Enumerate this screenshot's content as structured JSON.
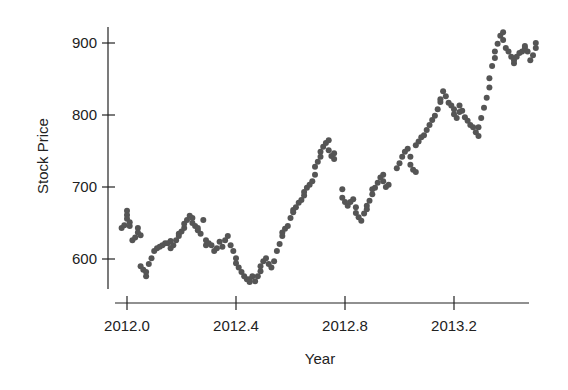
{
  "chart_data": {
    "type": "scatter",
    "title": "",
    "xlabel": "Year",
    "ylabel": "Stock Price",
    "xlim": [
      1999.9,
      2013.58
    ],
    "x_axis_range": [
      1999.98,
      2013.51
    ],
    "ylim": [
      560,
      920
    ],
    "x_ticks": [
      2012.0,
      2012.4,
      2012.8,
      2013.2
    ],
    "x_tick_labels": [
      "2012.0",
      "2012.4",
      "2012.8",
      "2013.2"
    ],
    "y_ticks": [
      600,
      700,
      800,
      900
    ],
    "y_tick_labels": [
      "600",
      "700",
      "800",
      "900"
    ],
    "grid": false,
    "legend": null,
    "point_color": "#555555",
    "series": [
      {
        "name": "Stock Price",
        "points": [
          [
            2011.98,
            643
          ],
          [
            2011.99,
            647
          ],
          [
            2012.0,
            667
          ],
          [
            2012.0,
            661
          ],
          [
            2012.0,
            656
          ],
          [
            2012.01,
            651
          ],
          [
            2012.01,
            646
          ],
          [
            2012.02,
            626
          ],
          [
            2012.03,
            630
          ],
          [
            2012.04,
            637
          ],
          [
            2012.04,
            643
          ],
          [
            2012.05,
            633
          ],
          [
            2012.05,
            590
          ],
          [
            2012.06,
            585
          ],
          [
            2012.07,
            576
          ],
          [
            2012.07,
            582
          ],
          [
            2012.08,
            593
          ],
          [
            2012.09,
            601
          ],
          [
            2012.1,
            611
          ],
          [
            2012.11,
            615
          ],
          [
            2012.12,
            617
          ],
          [
            2012.13,
            619
          ],
          [
            2012.14,
            622
          ],
          [
            2012.15,
            622
          ],
          [
            2012.16,
            625
          ],
          [
            2012.16,
            615
          ],
          [
            2012.17,
            619
          ],
          [
            2012.18,
            626
          ],
          [
            2012.19,
            632
          ],
          [
            2012.19,
            635
          ],
          [
            2012.2,
            638
          ],
          [
            2012.21,
            643
          ],
          [
            2012.21,
            649
          ],
          [
            2012.22,
            654
          ],
          [
            2012.23,
            660
          ],
          [
            2012.24,
            657
          ],
          [
            2012.24,
            650
          ],
          [
            2012.25,
            646
          ],
          [
            2012.26,
            643
          ],
          [
            2012.26,
            640
          ],
          [
            2012.27,
            635
          ],
          [
            2012.28,
            654
          ],
          [
            2012.29,
            626
          ],
          [
            2012.29,
            619
          ],
          [
            2012.3,
            622
          ],
          [
            2012.31,
            619
          ],
          [
            2012.32,
            611
          ],
          [
            2012.33,
            615
          ],
          [
            2012.34,
            624
          ],
          [
            2012.35,
            617
          ],
          [
            2012.36,
            626
          ],
          [
            2012.37,
            632
          ],
          [
            2012.38,
            619
          ],
          [
            2012.39,
            611
          ],
          [
            2012.4,
            601
          ],
          [
            2012.4,
            594
          ],
          [
            2012.41,
            588
          ],
          [
            2012.42,
            582
          ],
          [
            2012.43,
            576
          ],
          [
            2012.44,
            572
          ],
          [
            2012.45,
            568
          ],
          [
            2012.45,
            572
          ],
          [
            2012.46,
            576
          ],
          [
            2012.47,
            569
          ],
          [
            2012.48,
            576
          ],
          [
            2012.49,
            583
          ],
          [
            2012.49,
            590
          ],
          [
            2012.5,
            597
          ],
          [
            2012.51,
            601
          ],
          [
            2012.52,
            593
          ],
          [
            2012.53,
            588
          ],
          [
            2012.54,
            597
          ],
          [
            2012.55,
            611
          ],
          [
            2012.56,
            621
          ],
          [
            2012.57,
            632
          ],
          [
            2012.57,
            637
          ],
          [
            2012.58,
            642
          ],
          [
            2012.59,
            646
          ],
          [
            2012.6,
            657
          ],
          [
            2012.61,
            665
          ],
          [
            2012.61,
            668
          ],
          [
            2012.62,
            672
          ],
          [
            2012.63,
            678
          ],
          [
            2012.64,
            682
          ],
          [
            2012.65,
            688
          ],
          [
            2012.65,
            693
          ],
          [
            2012.66,
            699
          ],
          [
            2012.67,
            703
          ],
          [
            2012.68,
            708
          ],
          [
            2012.69,
            717
          ],
          [
            2012.69,
            728
          ],
          [
            2012.7,
            735
          ],
          [
            2012.71,
            742
          ],
          [
            2012.71,
            749
          ],
          [
            2012.72,
            756
          ],
          [
            2012.73,
            761
          ],
          [
            2012.74,
            765
          ],
          [
            2012.74,
            751
          ],
          [
            2012.75,
            743
          ],
          [
            2012.76,
            739
          ],
          [
            2012.76,
            747
          ],
          [
            2012.79,
            697
          ],
          [
            2012.79,
            685
          ],
          [
            2012.8,
            679
          ],
          [
            2012.81,
            674
          ],
          [
            2012.82,
            679
          ],
          [
            2012.83,
            683
          ],
          [
            2012.84,
            672
          ],
          [
            2012.84,
            664
          ],
          [
            2012.85,
            658
          ],
          [
            2012.86,
            653
          ],
          [
            2012.87,
            663
          ],
          [
            2012.88,
            669
          ],
          [
            2012.88,
            674
          ],
          [
            2012.89,
            681
          ],
          [
            2012.9,
            690
          ],
          [
            2012.9,
            697
          ],
          [
            2012.91,
            699
          ],
          [
            2012.92,
            706
          ],
          [
            2012.93,
            713
          ],
          [
            2012.94,
            717
          ],
          [
            2012.94,
            708
          ],
          [
            2012.95,
            700
          ],
          [
            2012.96,
            703
          ],
          [
            2012.99,
            726
          ],
          [
            2013.0,
            733
          ],
          [
            2013.01,
            742
          ],
          [
            2013.02,
            749
          ],
          [
            2013.03,
            753
          ],
          [
            2013.04,
            742
          ],
          [
            2013.04,
            731
          ],
          [
            2013.05,
            724
          ],
          [
            2013.06,
            721
          ],
          [
            2013.06,
            758
          ],
          [
            2013.07,
            763
          ],
          [
            2013.08,
            769
          ],
          [
            2013.09,
            772
          ],
          [
            2013.1,
            779
          ],
          [
            2013.11,
            786
          ],
          [
            2013.12,
            793
          ],
          [
            2013.13,
            799
          ],
          [
            2013.14,
            808
          ],
          [
            2013.15,
            818
          ],
          [
            2013.15,
            822
          ],
          [
            2013.16,
            833
          ],
          [
            2013.17,
            826
          ],
          [
            2013.18,
            817
          ],
          [
            2013.19,
            813
          ],
          [
            2013.2,
            808
          ],
          [
            2013.2,
            801
          ],
          [
            2013.21,
            796
          ],
          [
            2013.22,
            804
          ],
          [
            2013.22,
            813
          ],
          [
            2013.23,
            806
          ],
          [
            2013.24,
            797
          ],
          [
            2013.25,
            792
          ],
          [
            2013.26,
            786
          ],
          [
            2013.27,
            783
          ],
          [
            2013.28,
            776
          ],
          [
            2013.29,
            771
          ],
          [
            2013.29,
            783
          ],
          [
            2013.3,
            796
          ],
          [
            2013.31,
            810
          ],
          [
            2013.32,
            824
          ],
          [
            2013.33,
            838
          ],
          [
            2013.33,
            851
          ],
          [
            2013.34,
            868
          ],
          [
            2013.35,
            879
          ],
          [
            2013.35,
            888
          ],
          [
            2013.36,
            899
          ],
          [
            2013.37,
            910
          ],
          [
            2013.38,
            915
          ],
          [
            2013.38,
            904
          ],
          [
            2013.39,
            893
          ],
          [
            2013.4,
            888
          ],
          [
            2013.41,
            881
          ],
          [
            2013.42,
            872
          ],
          [
            2013.42,
            876
          ],
          [
            2013.43,
            881
          ],
          [
            2013.44,
            886
          ],
          [
            2013.45,
            888
          ],
          [
            2013.46,
            893
          ],
          [
            2013.46,
            896
          ],
          [
            2013.47,
            888
          ],
          [
            2013.48,
            876
          ],
          [
            2013.49,
            883
          ],
          [
            2013.5,
            893
          ],
          [
            2013.5,
            900
          ]
        ]
      }
    ]
  }
}
